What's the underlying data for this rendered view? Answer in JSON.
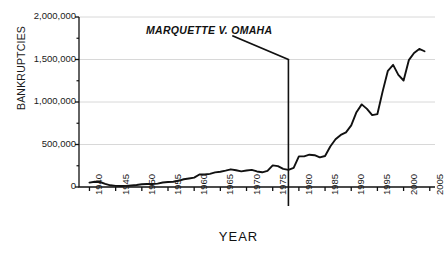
{
  "chart_data": {
    "type": "line",
    "title": "",
    "xlabel": "YEAR",
    "ylabel": "BANKRUPTCIES",
    "xlim": [
      1938,
      2006
    ],
    "ylim": [
      0,
      2000000
    ],
    "grid": true,
    "legend": null,
    "y_ticks": [
      0,
      500000,
      1000000,
      1500000,
      2000000
    ],
    "y_tick_labels": [
      "0",
      "500,000",
      "1,000,000",
      "1,500,000",
      "2,000,000"
    ],
    "y_minor_ticks": [
      250000,
      750000,
      1250000,
      1750000
    ],
    "x_ticks": [
      1940,
      1945,
      1950,
      1955,
      1960,
      1965,
      1970,
      1975,
      1980,
      1985,
      1990,
      1995,
      2000,
      2005
    ],
    "x_tick_labels": [
      "1940",
      "1945",
      "1950",
      "1955",
      "1960",
      "1965",
      "1970",
      "1975",
      "1980",
      "1985",
      "1990",
      "1995",
      "2000",
      "2005"
    ],
    "series": [
      {
        "name": "Bankruptcies",
        "color": "#111111",
        "x": [
          1940,
          1941,
          1942,
          1943,
          1944,
          1945,
          1946,
          1947,
          1948,
          1949,
          1950,
          1951,
          1952,
          1953,
          1954,
          1955,
          1956,
          1957,
          1958,
          1959,
          1960,
          1961,
          1962,
          1963,
          1964,
          1965,
          1966,
          1967,
          1968,
          1969,
          1970,
          1971,
          1972,
          1973,
          1974,
          1975,
          1976,
          1977,
          1978,
          1979,
          1980,
          1981,
          1982,
          1983,
          1984,
          1985,
          1986,
          1987,
          1988,
          1989,
          1990,
          1991,
          1992,
          1993,
          1994,
          1995,
          1996,
          1997,
          1998,
          1999,
          2000,
          2001,
          2002,
          2003,
          2004
        ],
        "y": [
          52000,
          62000,
          59000,
          36000,
          20000,
          13000,
          11000,
          13000,
          18000,
          24000,
          33000,
          36000,
          35000,
          40000,
          53000,
          59000,
          62000,
          73000,
          91000,
          100000,
          110000,
          147000,
          147000,
          155000,
          172000,
          180000,
          192000,
          208000,
          197000,
          184000,
          194000,
          201000,
          183000,
          173000,
          189000,
          254000,
          246000,
          214000,
          202000,
          226000,
          360000,
          360000,
          380000,
          374000,
          348000,
          365000,
          477000,
          561000,
          613000,
          643000,
          725000,
          880000,
          972000,
          919000,
          845000,
          858000,
          1125000,
          1367000,
          1437000,
          1319000,
          1253000,
          1492000,
          1577000,
          1625000,
          1597000
        ]
      }
    ],
    "annotations": [
      {
        "text": "MARQUETTE V. OMAHA",
        "marker_year": 1978,
        "marker_top_value": 1500000,
        "marker_bottom_value": 0
      }
    ]
  },
  "axis": {
    "y_title": "BANKRUPTCIES",
    "x_title": "YEAR"
  },
  "colors": {
    "line": "#111111",
    "grid": "#d8d8d8",
    "axis": "#111111",
    "text": "#1a1a1a"
  }
}
